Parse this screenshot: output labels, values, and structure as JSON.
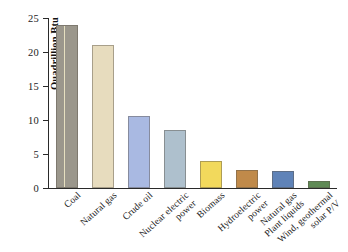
{
  "chart_data": {
    "type": "bar",
    "title": "",
    "xlabel": "",
    "ylabel": "Quadrillion Btu",
    "ylim": [
      0,
      25
    ],
    "yticks": [
      0,
      5,
      10,
      15,
      20,
      25
    ],
    "ytick_labels": [
      "0",
      "5",
      "10",
      "15",
      "20",
      "25"
    ],
    "grid": false,
    "legend": "none",
    "categories": [
      "Coal",
      "Natural gas",
      "Crude oil",
      "Nuclear electric power",
      "Biomass",
      "Hydroelectric power",
      "Natural gas Plant liquids",
      "Wind, geothermal solar P/V"
    ],
    "category_lines": [
      [
        "Coal",
        ""
      ],
      [
        "Natural gas",
        ""
      ],
      [
        "Crude oil",
        ""
      ],
      [
        "Nuclear electric",
        "power"
      ],
      [
        "Biomass",
        ""
      ],
      [
        "Hydroelectric",
        "power"
      ],
      [
        "Natural gas",
        "Plant liquids"
      ],
      [
        "Wind, geothermal",
        "solar P/V"
      ]
    ],
    "values": [
      24.0,
      21.0,
      10.6,
      8.6,
      4.0,
      2.6,
      2.5,
      1.1
    ],
    "colors": [
      "#9b978c",
      "#e7dcbe",
      "#a9b9e2",
      "#aec0cd",
      "#f2d95c",
      "#c08a4a",
      "#5f83b8",
      "#5f8a55"
    ],
    "axis_color": "#2a2a2a"
  }
}
